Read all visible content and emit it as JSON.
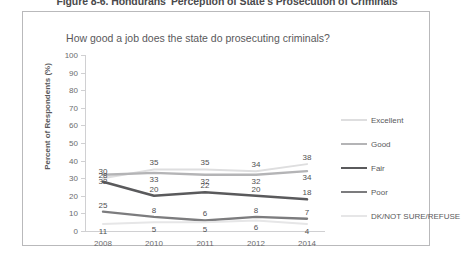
{
  "figure": {
    "caption": "Figure 8-6. Hondurans' Perception of State's Prosecution of Criminals"
  },
  "chart_data": {
    "type": "line",
    "title": "How good a job does the state do prosecuting criminals?",
    "xlabel": "",
    "ylabel": "Percent of Respondents (%)",
    "categories": [
      "2008",
      "2010",
      "2011",
      "2012",
      "2014"
    ],
    "ylim": [
      0,
      100
    ],
    "yticks": [
      "0",
      "10",
      "20",
      "30",
      "40",
      "50",
      "60",
      "70",
      "80",
      "90",
      "100"
    ],
    "grid": false,
    "legend_position": "right",
    "series": [
      {
        "name": "Excellent",
        "color": "#dededf",
        "width": 2.0,
        "values": [
          30,
          35,
          35,
          34,
          38
        ]
      },
      {
        "name": "Good",
        "color": "#b4b4b6",
        "width": 2.4,
        "values": [
          32,
          33,
          32,
          32,
          34
        ]
      },
      {
        "name": "Fair",
        "color": "#5a5a5c",
        "width": 2.6,
        "values": [
          28,
          20,
          22,
          20,
          18
        ]
      },
      {
        "name": "Poor",
        "color": "#7c7c7e",
        "width": 2.4,
        "values": [
          11,
          8,
          6,
          8,
          7
        ]
      },
      {
        "name": "DK/NOT SURE/REFUSE",
        "color": "#e6e6e7",
        "width": 2.0,
        "values": [
          4,
          5,
          5,
          6,
          4
        ]
      }
    ],
    "point_labels": [
      {
        "series": "Excellent",
        "x": 0,
        "value": "30"
      },
      {
        "series": "Excellent",
        "x": 1,
        "value": "35"
      },
      {
        "series": "Excellent",
        "x": 2,
        "value": "35"
      },
      {
        "series": "Excellent",
        "x": 3,
        "value": "34"
      },
      {
        "series": "Excellent",
        "x": 4,
        "value": "38"
      },
      {
        "series": "Good",
        "x": 0,
        "value": "32"
      },
      {
        "series": "Good",
        "x": 1,
        "value": "33"
      },
      {
        "series": "Good",
        "x": 2,
        "value": "32"
      },
      {
        "series": "Good",
        "x": 3,
        "value": "32"
      },
      {
        "series": "Good",
        "x": 4,
        "value": "34"
      },
      {
        "series": "Fair",
        "x": 0,
        "value": "28"
      },
      {
        "series": "Fair",
        "x": 1,
        "value": "20"
      },
      {
        "series": "Fair",
        "x": 2,
        "value": "22"
      },
      {
        "series": "Fair",
        "x": 3,
        "value": "20"
      },
      {
        "series": "Fair",
        "x": 4,
        "value": "18"
      },
      {
        "series": "Poor",
        "x": 0,
        "value": "25"
      },
      {
        "series": "Poor",
        "x": 1,
        "value": "8"
      },
      {
        "series": "Poor",
        "x": 2,
        "value": "6"
      },
      {
        "series": "Poor",
        "x": 3,
        "value": "8"
      },
      {
        "series": "Poor",
        "x": 4,
        "value": "7"
      },
      {
        "series": "DK/NOT SURE/REFUSE",
        "x": 0,
        "value": "11"
      },
      {
        "series": "DK/NOT SURE/REFUSE",
        "x": 1,
        "value": "5"
      },
      {
        "series": "DK/NOT SURE/REFUSE",
        "x": 2,
        "value": "5"
      },
      {
        "series": "DK/NOT SURE/REFUSE",
        "x": 3,
        "value": "6"
      },
      {
        "series": "DK/NOT SURE/REFUSE",
        "x": 4,
        "value": "4"
      }
    ]
  }
}
